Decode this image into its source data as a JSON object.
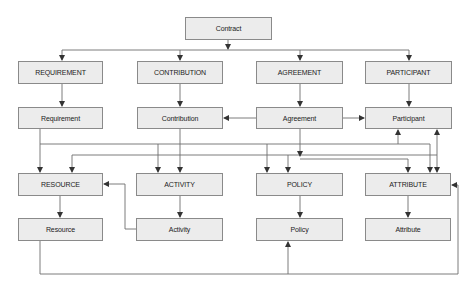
{
  "diagram": {
    "root": {
      "label": "Contract"
    },
    "row1": [
      {
        "id": "requirement-entity",
        "label": "REQUIREMENT"
      },
      {
        "id": "contribution-entity",
        "label": "CONTRIBUTION"
      },
      {
        "id": "agreement-entity",
        "label": "AGREEMENT"
      },
      {
        "id": "participant-entity",
        "label": "PARTICIPANT"
      }
    ],
    "row2": [
      {
        "id": "requirement-class",
        "label": "Requirement"
      },
      {
        "id": "contribution-class",
        "label": "Contribution"
      },
      {
        "id": "agreement-class",
        "label": "Agreement"
      },
      {
        "id": "participant-class",
        "label": "Participant"
      }
    ],
    "row3": [
      {
        "id": "resource-entity",
        "label": "RESOURCE"
      },
      {
        "id": "activity-entity",
        "label": "ACTIVITY"
      },
      {
        "id": "policy-entity",
        "label": "POLICY"
      },
      {
        "id": "attribute-entity",
        "label": "ATTRIBUTE"
      }
    ],
    "row4": [
      {
        "id": "resource-class",
        "label": "Resource"
      },
      {
        "id": "activity-class",
        "label": "Activity"
      },
      {
        "id": "policy-class",
        "label": "Policy"
      },
      {
        "id": "attribute-class",
        "label": "Attribute"
      }
    ],
    "colors": {
      "box_fill": "#ececec",
      "box_border": "#8a8a8a",
      "line": "#6e6e6e",
      "text": "#222222"
    }
  }
}
